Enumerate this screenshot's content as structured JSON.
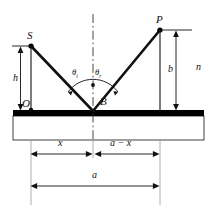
{
  "figure": {
    "type": "optics-reflection-diagram",
    "title": "",
    "colors": {
      "stroke": "#111111",
      "mirror": "#000000",
      "slab_fill": "#ffffff",
      "dimension_line": "#111111",
      "background": "#ffffff"
    }
  },
  "points": [
    {
      "id": "S",
      "label": "S",
      "desc": "source-point",
      "x": 31,
      "y": 46
    },
    {
      "id": "B",
      "label": "B",
      "desc": "reflection-point-on-mirror",
      "x": 93,
      "y": 110
    },
    {
      "id": "P",
      "label": "P",
      "desc": "detector-point",
      "x": 160,
      "y": 30
    },
    {
      "id": "O",
      "label": "O",
      "desc": "origin-foot-of-source",
      "x": 31,
      "y": 110
    }
  ],
  "angles": [
    {
      "id": "theta_i",
      "symbol": "θ",
      "subscript": "i",
      "desc": "angle-of-incidence"
    },
    {
      "id": "theta_r",
      "symbol": "θ",
      "subscript": "r",
      "desc": "angle-of-reflection"
    }
  ],
  "dimensions": [
    {
      "id": "h",
      "label": "h",
      "desc": "height-of-source-above-mirror",
      "orientation": "vertical"
    },
    {
      "id": "b",
      "label": "b",
      "desc": "height-of-detector-above-mirror",
      "orientation": "vertical"
    },
    {
      "id": "x",
      "label": "x",
      "desc": "horizontal-distance-O-to-B",
      "orientation": "horizontal"
    },
    {
      "id": "a_minus_x",
      "label": "a − x",
      "desc": "horizontal-distance-B-to-P",
      "orientation": "horizontal"
    },
    {
      "id": "a",
      "label": "a",
      "desc": "total-horizontal-separation",
      "orientation": "horizontal"
    }
  ],
  "media": [
    {
      "id": "n",
      "label": "n",
      "desc": "refractive-index-of-medium"
    }
  ],
  "elements": {
    "mirror_label": "mirror-surface",
    "slab_label": "glass-slab",
    "normal_label": "normal-dash-dot-line",
    "incident_ray_label": "incident-ray-S-to-B",
    "reflected_ray_label": "reflected-ray-B-to-P"
  }
}
